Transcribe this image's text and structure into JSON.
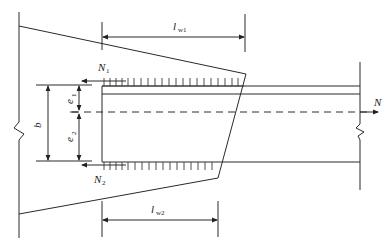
{
  "diagram": {
    "type": "structural-connection-weld-diagram",
    "labels": {
      "lw1": {
        "main": "l",
        "sub": "w1"
      },
      "lw2": {
        "main": "l",
        "sub": "w2"
      },
      "N1": {
        "main": "N",
        "sub": "1"
      },
      "N2": {
        "main": "N",
        "sub": "2"
      },
      "e1": {
        "main": "e",
        "sub": "1"
      },
      "e2": {
        "main": "e",
        "sub": "2"
      },
      "b": {
        "main": "b"
      },
      "N": {
        "main": "N"
      }
    },
    "colors": {
      "line": "#2a2a2a",
      "background": "#ffffff"
    }
  }
}
